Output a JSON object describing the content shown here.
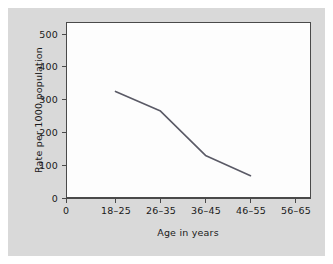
{
  "figure": {
    "background_color": "#d9d9d9",
    "plot_background_color": "#fdfdfd",
    "border_color": "#4a4a4a",
    "line_color": "#5a5a66"
  },
  "chart_data": {
    "type": "line",
    "title": "",
    "subtitle": "",
    "xlabel": "Age in years",
    "ylabel": "Rate per 1000 population",
    "categories": [
      "0",
      "18–25",
      "26–35",
      "36–45",
      "46–55",
      "56–65"
    ],
    "xtick_labels": [
      "0",
      "18–25",
      "26–35",
      "36–45",
      "46–55",
      "56–65"
    ],
    "ytick_labels": [
      "0",
      "100",
      "200",
      "300",
      "400",
      "500"
    ],
    "ytick_values": [
      0,
      100,
      200,
      300,
      400,
      500
    ],
    "ylim": [
      0,
      540
    ],
    "grid": false,
    "legend": null,
    "series": [
      {
        "name": "Rate per 1000 population",
        "x": [
          "18–25",
          "26–35",
          "36–45",
          "46–55"
        ],
        "values": [
          325,
          265,
          130,
          68
        ]
      }
    ],
    "points": [
      {
        "category": "18–25",
        "value": 325
      },
      {
        "category": "26–35",
        "value": 265
      },
      {
        "category": "36–45",
        "value": 130
      },
      {
        "category": "46–55",
        "value": 68
      }
    ]
  }
}
